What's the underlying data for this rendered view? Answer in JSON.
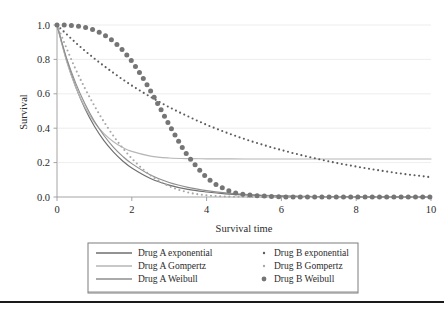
{
  "chart_data": {
    "type": "line",
    "title": "",
    "xlabel": "Survival time",
    "ylabel": "Survival",
    "xlim": [
      0,
      10
    ],
    "ylim": [
      0,
      1.0
    ],
    "xticks": [
      "0",
      "2",
      "4",
      "6",
      "8",
      "10"
    ],
    "xtick_values": [
      0,
      2,
      4,
      6,
      8,
      10
    ],
    "yticks": [
      "0.0",
      "0.2",
      "0.4",
      "0.6",
      "0.8",
      "1.0"
    ],
    "ytick_values": [
      0.0,
      0.2,
      0.4,
      0.6,
      0.8,
      1.0
    ],
    "grid": "horizontal",
    "legend_position": "below-center",
    "series": [
      {
        "name": "Drug A exponential",
        "style": "solid-line",
        "color": "#6f6f6f",
        "marker": "none",
        "x": [
          0,
          0.25,
          0.5,
          0.75,
          1,
          1.25,
          1.5,
          1.75,
          2,
          2.5,
          3,
          3.5,
          4,
          4.5,
          5,
          6,
          7,
          8,
          9,
          10
        ],
        "y": [
          1.0,
          0.801,
          0.641,
          0.513,
          0.411,
          0.329,
          0.264,
          0.211,
          0.169,
          0.108,
          0.069,
          0.044,
          0.029,
          0.018,
          0.012,
          0.005,
          0.002,
          0.001,
          0.0003,
          0.0001
        ]
      },
      {
        "name": "Drug A Gompertz",
        "style": "solid-line",
        "color": "#b6b6b6",
        "marker": "none",
        "x": [
          0,
          0.25,
          0.5,
          0.75,
          1,
          1.25,
          1.5,
          1.75,
          2,
          2.5,
          3,
          3.5,
          4,
          4.5,
          5,
          6,
          7,
          8,
          9,
          10
        ],
        "y": [
          1.0,
          0.793,
          0.638,
          0.521,
          0.434,
          0.37,
          0.323,
          0.289,
          0.265,
          0.238,
          0.227,
          0.223,
          0.222,
          0.2215,
          0.2212,
          0.2211,
          0.2211,
          0.2211,
          0.2211,
          0.2211
        ]
      },
      {
        "name": "Drug A Weibull",
        "style": "solid-line",
        "color": "#8e8e8e",
        "marker": "none",
        "x": [
          0,
          0.25,
          0.5,
          0.75,
          1,
          1.25,
          1.5,
          1.75,
          2,
          2.5,
          3,
          3.5,
          4,
          4.5,
          5,
          6,
          7,
          8,
          9,
          10
        ],
        "y": [
          1.0,
          0.812,
          0.662,
          0.54,
          0.44,
          0.359,
          0.292,
          0.238,
          0.194,
          0.128,
          0.084,
          0.056,
          0.037,
          0.024,
          0.016,
          0.007,
          0.003,
          0.0012,
          0.0005,
          0.0002
        ]
      },
      {
        "name": "Drug B exponential",
        "style": "dotted",
        "color": "#5c5c5c",
        "marker": "small-dot",
        "x": [
          0,
          0.5,
          1,
          1.5,
          2,
          2.5,
          3,
          3.5,
          4,
          4.5,
          5,
          5.5,
          6,
          6.5,
          7,
          7.5,
          8,
          8.5,
          9,
          9.5,
          10
        ],
        "y": [
          1.0,
          0.897,
          0.805,
          0.723,
          0.648,
          0.582,
          0.522,
          0.469,
          0.42,
          0.377,
          0.338,
          0.304,
          0.273,
          0.245,
          0.22,
          0.197,
          0.177,
          0.159,
          0.142,
          0.128,
          0.115
        ]
      },
      {
        "name": "Drug B Gompertz",
        "style": "dotted",
        "color": "#a8a8a8",
        "marker": "small-dot",
        "x": [
          0,
          0.5,
          1,
          1.5,
          2,
          2.5,
          3,
          3.5,
          4,
          4.5,
          5,
          6,
          7,
          8,
          9,
          10
        ],
        "y": [
          1.0,
          0.742,
          0.53,
          0.358,
          0.224,
          0.126,
          0.063,
          0.027,
          0.01,
          0.003,
          0.001,
          0.0001,
          2e-05,
          0.0,
          0.0,
          0.0
        ]
      },
      {
        "name": "Drug B Weibull",
        "style": "dotted-large",
        "color": "#757575",
        "marker": "large-dot",
        "x": [
          0,
          0.25,
          0.5,
          0.75,
          1,
          1.25,
          1.5,
          1.75,
          2,
          2.25,
          2.5,
          2.75,
          3,
          3.25,
          3.5,
          4,
          4.5,
          5,
          6,
          7,
          8,
          9,
          10
        ],
        "y": [
          1.0,
          0.999,
          0.995,
          0.986,
          0.97,
          0.944,
          0.906,
          0.855,
          0.789,
          0.709,
          0.618,
          0.52,
          0.42,
          0.325,
          0.24,
          0.114,
          0.045,
          0.015,
          0.001,
          0.0,
          0.0,
          0.0,
          0.0
        ]
      }
    ]
  },
  "legend": {
    "entries": [
      {
        "label": "Drug A exponential",
        "marker": "solid-line",
        "color": "#6f6f6f"
      },
      {
        "label": "Drug A Gompertz",
        "marker": "solid-line",
        "color": "#b6b6b6"
      },
      {
        "label": "Drug A Weibull",
        "marker": "solid-line",
        "color": "#8e8e8e"
      },
      {
        "label": "Drug B exponential",
        "marker": "small-dot",
        "color": "#5c5c5c"
      },
      {
        "label": "Drug B Gompertz",
        "marker": "small-dot",
        "color": "#a8a8a8"
      },
      {
        "label": "Drug B Weibull",
        "marker": "large-dot",
        "color": "#757575"
      }
    ]
  },
  "colors": {
    "background": "#ffffff",
    "grid": "#e8e8e8",
    "axis": "#9a9a9a",
    "text": "#2b2b2b",
    "footer_rule": "#1a1a1a"
  }
}
